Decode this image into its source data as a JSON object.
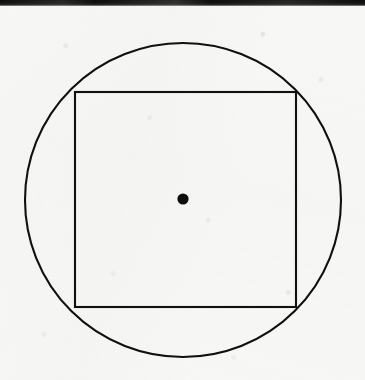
{
  "page": {
    "width": 365,
    "height": 380,
    "background_color": "#f7f7f5",
    "ink_color": "#101010"
  },
  "scan_artifacts": {
    "top_band": {
      "label": "black page edge band",
      "color": "#0c0c0c",
      "x": 0,
      "y": 0,
      "width": 365,
      "height": 6
    },
    "paper_noise": "faint gray speckle and mottling across scanned page"
  },
  "figure": {
    "type": "geometry-diagram",
    "caption": "",
    "shapes": [
      {
        "name": "circle",
        "kind": "circle",
        "center_x": 183,
        "center_y": 200,
        "radius": 157,
        "stroke_color": "#101010",
        "stroke_width": 2.1,
        "filled": false
      },
      {
        "name": "square",
        "kind": "rect",
        "x": 75,
        "y": 92,
        "width": 221,
        "height": 215,
        "stroke_color": "#101010",
        "stroke_width": 2.1,
        "filled": false
      },
      {
        "name": "center-dot",
        "kind": "dot",
        "center_x": 183,
        "center_y": 199,
        "radius": 5.6,
        "fill_color": "#0d0d0d",
        "filled": true
      }
    ]
  },
  "chart_data": {
    "type": "scatter",
    "title": "",
    "xlabel": "",
    "ylabel": "",
    "xlim": [
      0,
      365
    ],
    "ylim": [
      0,
      380
    ],
    "grid": false,
    "legend": null,
    "annotations": [
      "circle centered at (183, 200) with radius 157",
      "square from (75, 92) to (296, 307)",
      "filled point at (183, 199)"
    ],
    "series": [
      {
        "name": "center-point",
        "x": [
          183
        ],
        "y": [
          199
        ]
      }
    ]
  }
}
